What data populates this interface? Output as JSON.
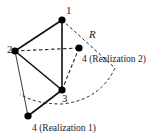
{
  "diagram": {
    "nodes": [
      {
        "id": "1",
        "label": "1",
        "x": 62,
        "y": 20,
        "lx": 66,
        "ly": 14
      },
      {
        "id": "2",
        "label": "2",
        "x": 15,
        "y": 51,
        "lx": 8,
        "ly": 51
      },
      {
        "id": "3",
        "label": "3",
        "x": 62,
        "y": 90,
        "lx": 62,
        "ly": 102
      },
      {
        "id": "4a",
        "label": "4 (Realization 1)",
        "x": 28,
        "y": 116,
        "lx": 32,
        "ly": 131
      },
      {
        "id": "4b",
        "label": "4 (Realization 2)",
        "x": 79,
        "y": 48,
        "lx": 82,
        "ly": 62
      }
    ],
    "edges": [
      {
        "from": "1",
        "to": "2",
        "style": "solid-thick"
      },
      {
        "from": "1",
        "to": "3",
        "style": "solid-thick"
      },
      {
        "from": "2",
        "to": "3",
        "style": "solid-thick"
      },
      {
        "from": "3",
        "to": "4a",
        "style": "solid-thick"
      },
      {
        "from": "2",
        "to": "4a",
        "style": "solid-thin"
      },
      {
        "from": "2",
        "to": "4b",
        "style": "dashed"
      },
      {
        "from": "3",
        "to": "4b",
        "style": "dashed"
      },
      {
        "from": "1",
        "to": "arc-end",
        "style": "dashed"
      }
    ],
    "radius_label": "R",
    "arc": {
      "style": "dashed",
      "start": [
        115,
        68
      ],
      "end": [
        20,
        95
      ]
    },
    "colors": {
      "stroke": "#111111",
      "node": "#000000",
      "background": "#ffffff"
    }
  }
}
